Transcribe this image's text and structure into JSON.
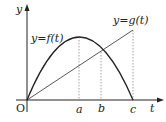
{
  "diagram": {
    "axis_y_label": "y",
    "axis_x_label": "t",
    "origin_label": "O",
    "curve_f_label": "y=f(t)",
    "curve_g_label": "y=g(t)",
    "tick_labels": [
      "a",
      "b",
      "c"
    ],
    "colors": {
      "stroke": "#222222",
      "dotted": "#888888",
      "background": "#ffffff"
    }
  }
}
